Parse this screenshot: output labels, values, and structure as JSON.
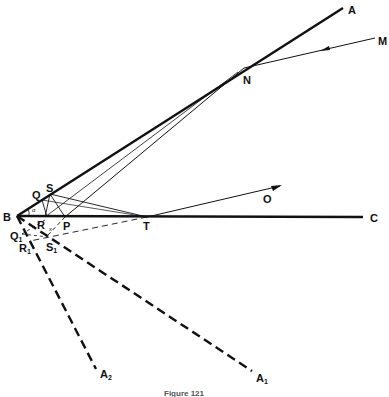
{
  "figure": {
    "caption": "Figure 121",
    "points": {
      "B": "B",
      "A": "A",
      "M": "M",
      "N": "N",
      "C": "C",
      "O": "O",
      "T": "T",
      "S": "S",
      "Q": "Q",
      "P": "P",
      "R": "R",
      "Q1": "Q",
      "Q1_sub": "1",
      "R1": "R",
      "R1_sub": "1",
      "S1": "S",
      "S1_sub": "1",
      "A1": "A",
      "A1_sub": "1",
      "A2": "A",
      "A2_sub": "2"
    },
    "angle_labels": {
      "alpha": "α",
      "x": "x"
    },
    "colors": {
      "ink": "#111111",
      "background": "#ffffff"
    }
  }
}
